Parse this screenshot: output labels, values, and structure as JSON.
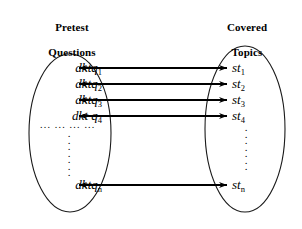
{
  "diagram": {
    "type": "set-mapping-diagram",
    "background_color": "#ffffff",
    "stroke_color": "#000000",
    "left_set": {
      "title": "Pretest\nQuestions",
      "title_line1": "Pretest",
      "title_line2": "Questions",
      "ellipse": {
        "cx": 70,
        "cy": 133,
        "rx": 41,
        "ry": 79
      },
      "items": [
        {
          "base": "dktq",
          "sub": "1",
          "label": "dktq1"
        },
        {
          "base": "dktq",
          "sub": "2",
          "label": "dktq2"
        },
        {
          "base": "dktq",
          "sub": "3",
          "label": "dktq3"
        },
        {
          "base": "dkt q",
          "sub": "4",
          "label": "dkt q4"
        },
        {
          "base": "dktq",
          "sub": "n",
          "label": "dktqn"
        }
      ],
      "ellipsis_horizontal": "... ... ... ...",
      "ellipsis_vertical_dots": 7
    },
    "right_set": {
      "title": "Covered\nTopics",
      "title_line1": "Covered",
      "title_line2": "Topics",
      "ellipse": {
        "cx": 245,
        "cy": 129,
        "rx": 40,
        "ry": 83
      },
      "items": [
        {
          "base": "st",
          "sub": "1",
          "label": "st1"
        },
        {
          "base": "st",
          "sub": "2",
          "label": "st2"
        },
        {
          "base": "st",
          "sub": "3",
          "label": "st3"
        },
        {
          "base": "st",
          "sub": "4",
          "label": "st4"
        },
        {
          "base": "st",
          "sub": "n",
          "label": "stn"
        }
      ],
      "ellipsis_vertical_dots": 7
    },
    "connections": [
      {
        "from": "dktq1",
        "to": "st1",
        "y": 68,
        "double_headed": true
      },
      {
        "from": "dktq2",
        "to": "st2",
        "y": 84,
        "double_headed": true
      },
      {
        "from": "dktq3",
        "to": "st3",
        "y": 100,
        "double_headed": true
      },
      {
        "from": "dkt q4",
        "to": "st4",
        "y": 116,
        "double_headed": true
      },
      {
        "from": "dktqn",
        "to": "stn",
        "y": 185,
        "double_headed": true
      }
    ],
    "arrow_span": {
      "x_left_tip": 78,
      "x_right_tip": 228
    }
  }
}
